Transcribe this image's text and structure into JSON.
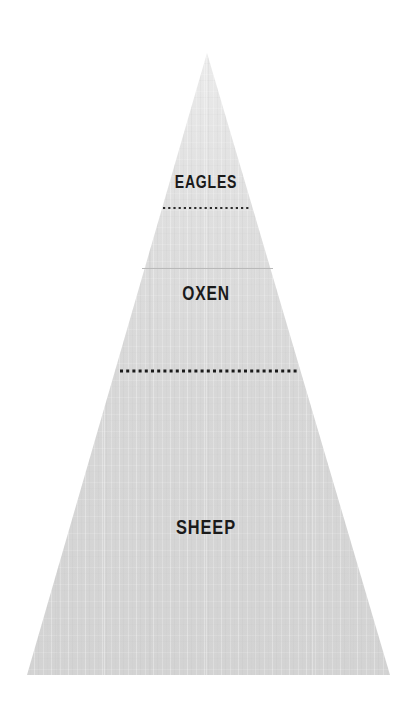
{
  "diagram": {
    "type": "pyramid",
    "title": "",
    "background_color": "#ffffff",
    "fill_color": "#d4d4d4",
    "fill_color_top": "#e7e7e7",
    "label_color": "#1a1a1a",
    "divider_color": "#1a1a1a",
    "faint_line_color": "#b9b9b9",
    "apex": {
      "x": 207,
      "y": 53
    },
    "base_left": {
      "x": 27,
      "y": 675
    },
    "base_right": {
      "x": 390,
      "y": 675
    },
    "tiers": [
      {
        "id": "tier-eagles",
        "rank": 1,
        "label": "EAGLES",
        "position": "top",
        "label_y": 181,
        "tier_top_y": 53,
        "tier_bottom_y": 208
      },
      {
        "id": "tier-oxen",
        "rank": 2,
        "label": "OXEN",
        "position": "middle",
        "label_y": 293,
        "tier_top_y": 208,
        "tier_bottom_y": 371
      },
      {
        "id": "tier-sheep",
        "rank": 3,
        "label": "SHEEP",
        "position": "bottom",
        "label_y": 526,
        "tier_top_y": 371,
        "tier_bottom_y": 675
      }
    ],
    "dividers": [
      {
        "id": "divider-eagles-oxen",
        "style": "dotted",
        "y": 208,
        "x_start": 163,
        "x_end": 251,
        "dot_size": 2.2,
        "dot_gap": 3.0,
        "color": "#2b2b2b"
      },
      {
        "id": "divider-oxen-sheep",
        "style": "dotted",
        "y": 371,
        "x_start": 120,
        "x_end": 297,
        "dot_size": 3.0,
        "dot_gap": 3.2,
        "color": "#1a1a1a"
      }
    ],
    "faint_lines": [
      {
        "id": "faint-line-upper",
        "style": "solid",
        "y": 268,
        "x_start": 142,
        "x_end": 273,
        "color": "#b9b9b9"
      }
    ]
  }
}
